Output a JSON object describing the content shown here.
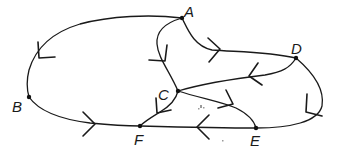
{
  "diagram": {
    "type": "directed-graph",
    "stroke_color": "#1a1a1a",
    "background": "#ffffff",
    "nodes": [
      {
        "id": "A",
        "label": "A",
        "x": 182,
        "y": 18,
        "label_x": 184,
        "label_y": 17
      },
      {
        "id": "B",
        "label": "B",
        "x": 29,
        "y": 97,
        "label_x": 12,
        "label_y": 112
      },
      {
        "id": "C",
        "label": "C",
        "x": 178,
        "y": 91,
        "label_x": 158,
        "label_y": 100
      },
      {
        "id": "D",
        "label": "D",
        "x": 296,
        "y": 58,
        "label_x": 291,
        "label_y": 54
      },
      {
        "id": "E",
        "label": "E",
        "x": 256,
        "y": 128,
        "label_x": 250,
        "label_y": 146
      },
      {
        "id": "F",
        "label": "F",
        "x": 140,
        "y": 126,
        "label_x": 134,
        "label_y": 145
      }
    ],
    "edges": [
      {
        "from": "A",
        "to": "B"
      },
      {
        "from": "B",
        "to": "F"
      },
      {
        "from": "A",
        "to": "C"
      },
      {
        "from": "A",
        "to": "D"
      },
      {
        "from": "D",
        "to": "C"
      },
      {
        "from": "C",
        "to": "E"
      },
      {
        "from": "E",
        "to": "F"
      },
      {
        "from": "D",
        "to": "E"
      },
      {
        "from": "C",
        "to": "F"
      }
    ]
  }
}
